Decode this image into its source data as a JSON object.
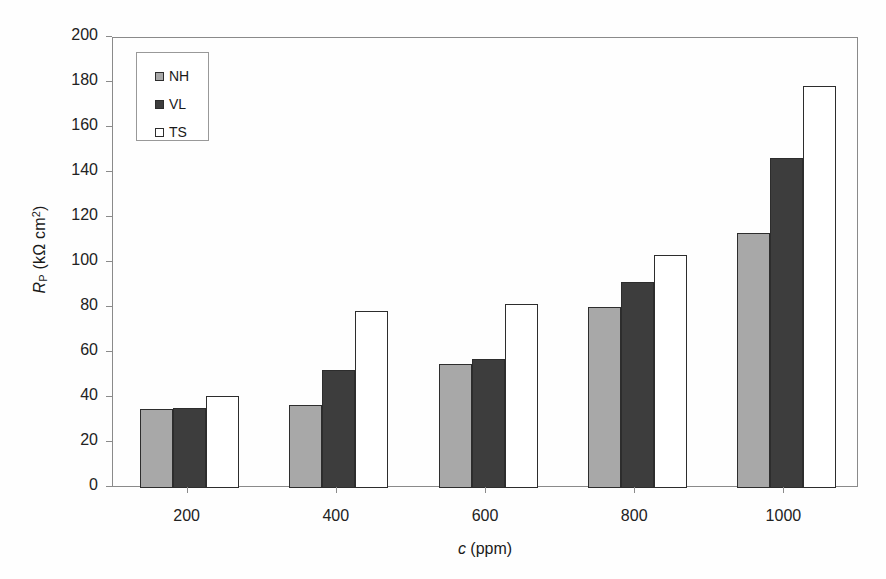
{
  "chart_data": {
    "type": "bar",
    "title": "",
    "xlabel": "c (ppm)",
    "xlabel_parts": {
      "symbol": "c",
      "unit": "(ppm)"
    },
    "ylabel": "RP (kΩ cm2)",
    "ylabel_parts": {
      "symbol": "R",
      "subscript": "P",
      "unit_open": " (k",
      "unit_ohm": "Ω",
      "unit_cm": " cm",
      "unit_sup": "2",
      "unit_close": ")"
    },
    "categories": [
      "200",
      "400",
      "600",
      "800",
      "1000"
    ],
    "series": [
      {
        "name": "NH",
        "color": "#a8a8a8",
        "values": [
          35,
          37,
          55,
          80.5,
          113.5
        ]
      },
      {
        "name": "VL",
        "color": "#3d3d3d",
        "values": [
          35.5,
          52.5,
          57.5,
          91.5,
          146.5
        ]
      },
      {
        "name": "TS",
        "color": "#ffffff",
        "values": [
          41,
          78.5,
          82,
          103.5,
          178.5
        ]
      }
    ],
    "ylim": [
      0,
      200
    ],
    "yticks": [
      0,
      20,
      40,
      60,
      80,
      100,
      120,
      140,
      160,
      180,
      200
    ],
    "ytick_labels": [
      "0",
      "20",
      "40",
      "60",
      "80",
      "100",
      "120",
      "140",
      "160",
      "180",
      "200"
    ],
    "grid": false,
    "legend_position": "top-left",
    "legend_entries": [
      "NH",
      "VL",
      "TS"
    ],
    "axis_color": "#8a8a8a",
    "bar_edge_color": "#2d2d2d",
    "background": "#ffffff"
  }
}
